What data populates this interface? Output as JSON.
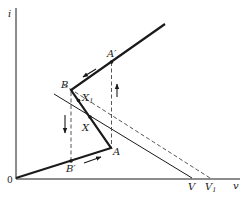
{
  "diagram": {
    "axes": {
      "y_label": "i",
      "x_label": "v",
      "origin_label": "0"
    },
    "points": {
      "A": "A",
      "A_prime": "A′",
      "B": "B",
      "B_prime": "B′",
      "X": "X",
      "X1_base": "X",
      "X1_sub": "1",
      "V": "V",
      "V1_base": "V",
      "V1_sub": "1"
    },
    "curves": [
      {
        "name": "characteristic",
        "style": "thick-solid",
        "path": [
          "0",
          "A",
          "B",
          "A′",
          "upper-end"
        ]
      },
      {
        "name": "load-line",
        "style": "solid",
        "through": "X",
        "ends_at": "V"
      },
      {
        "name": "shifted-load-line",
        "style": "dashed",
        "through": "X1",
        "ends_at": "V1"
      },
      {
        "name": "jump-down",
        "style": "dashed-vertical",
        "from": "B",
        "to": "B′"
      },
      {
        "name": "jump-up",
        "style": "dashed-vertical",
        "from": "A",
        "to": "A′"
      }
    ],
    "arrows": [
      {
        "name": "arrow-along-upper-branch",
        "direction": "down-left"
      },
      {
        "name": "arrow-jump-up",
        "direction": "up"
      },
      {
        "name": "arrow-jump-down",
        "direction": "down"
      },
      {
        "name": "arrow-along-lower-branch",
        "direction": "right"
      }
    ],
    "colors": {
      "ink": "#1a1a1a",
      "dashed": "#444444",
      "background": "#ffffff"
    }
  }
}
